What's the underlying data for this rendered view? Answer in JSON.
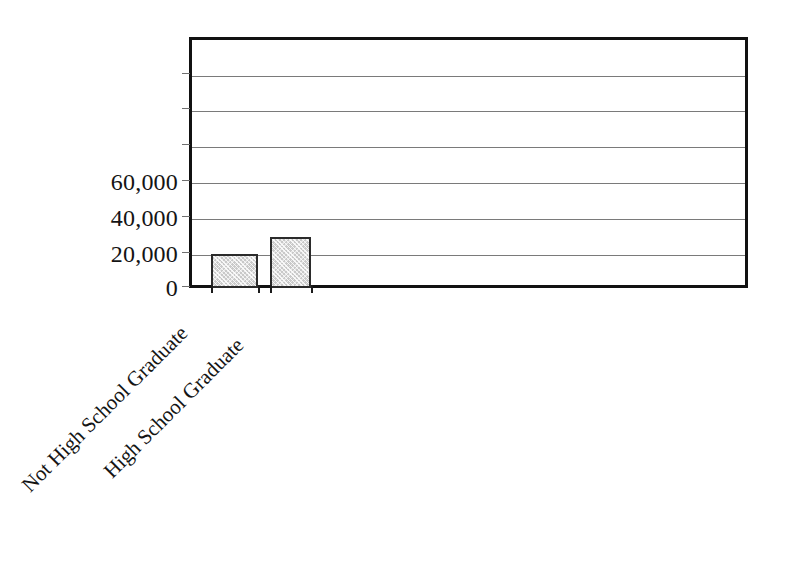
{
  "chart_data": {
    "type": "bar",
    "title": "",
    "subtitle": "",
    "xlabel": "",
    "ylabel": "",
    "categories": [
      "Not High School Graduate",
      "High School Graduate"
    ],
    "values": [
      19500,
      29000
    ],
    "ylim": [
      0,
      140000
    ],
    "ytick_values": [
      0,
      20000,
      40000,
      60000,
      80000,
      100000,
      120000,
      140000
    ],
    "ytick_labels_visible": [
      "0",
      "20,000",
      "40,000",
      "60,000"
    ],
    "gridlines": {
      "horizontal": true,
      "vertical": false,
      "count": 6,
      "color": "#7a7a7a"
    },
    "legend": {
      "visible": false,
      "position": "none",
      "entries": []
    },
    "annotations": [],
    "series": [
      {
        "name": "Earnings",
        "values": [
          19500,
          29000
        ]
      }
    ],
    "bar_style": {
      "fill_color": "#c9c9c9",
      "edge_color": "#2b2b2b",
      "pattern": "hatch"
    },
    "frame_color": "#111111",
    "background_color": "#ffffff"
  },
  "axis": {
    "y_labels": [
      {
        "text": "60,000",
        "value": 60000
      },
      {
        "text": "40,000",
        "value": 40000
      },
      {
        "text": "20,000",
        "value": 20000
      },
      {
        "text": "0",
        "value": 0
      }
    ],
    "x_labels": [
      {
        "text": "Not High School Graduate"
      },
      {
        "text": "High School Graduate"
      }
    ]
  }
}
